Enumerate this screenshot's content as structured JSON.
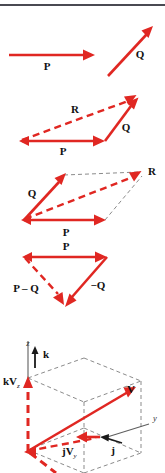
{
  "figure": {
    "title_rule": "horizontal-divider",
    "accent_color": "#e02722",
    "guide_color": "#8b8b8b",
    "axis_color": "#5f5f5f",
    "text_color": "#111111",
    "background": "#ffffff",
    "width": 165,
    "height": 473
  },
  "panels": [
    {
      "id": "panel-separate-vectors",
      "labels": {
        "p": "P",
        "q": "Q"
      }
    },
    {
      "id": "panel-triangle-addition",
      "labels": {
        "p": "P",
        "q": "Q",
        "r": "R"
      }
    },
    {
      "id": "panel-parallelogram-addition",
      "labels": {
        "p": "P",
        "q": "Q",
        "r": "R"
      }
    },
    {
      "id": "panel-vector-subtraction",
      "labels": {
        "p": "P",
        "neg_q": "−Q",
        "p_minus_q": "P – Q"
      }
    },
    {
      "id": "panel-3d-components",
      "labels": {
        "z_axis": "z",
        "y_axis": "y",
        "k_hat": "k",
        "j_hat": "j",
        "k_vz": "kV",
        "k_vz_sub": "z",
        "j_vy": "jV",
        "j_vy_sub": "y",
        "v": "V"
      }
    }
  ]
}
